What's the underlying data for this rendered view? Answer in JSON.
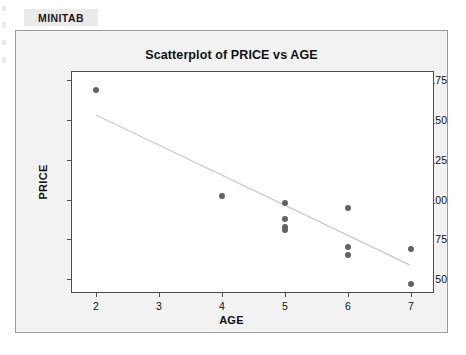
{
  "page": {
    "label": "MINITAB"
  },
  "chart_data": {
    "type": "scatter",
    "title": "Scatterplot of PRICE vs AGE",
    "xlabel": "AGE",
    "ylabel": "PRICE",
    "xlim": [
      1.62,
      7.35
    ],
    "ylim": [
      42,
      180
    ],
    "xticks": [
      2,
      3,
      4,
      5,
      6,
      7
    ],
    "yticks": [
      50,
      75,
      100,
      125,
      150,
      175
    ],
    "xtick_labels": [
      "2",
      "3",
      "4",
      "5",
      "6",
      "7"
    ],
    "ytick_labels": [
      "50",
      "75",
      "100",
      "125",
      "150",
      "175"
    ],
    "grid": false,
    "legend": false,
    "marker_color": "#636363",
    "fit_line_color": "#c9c9c9",
    "points": [
      {
        "x": 2,
        "y": 169
      },
      {
        "x": 4,
        "y": 102
      },
      {
        "x": 5,
        "y": 98
      },
      {
        "x": 5,
        "y": 88
      },
      {
        "x": 5,
        "y": 83
      },
      {
        "x": 5,
        "y": 81
      },
      {
        "x": 6,
        "y": 95
      },
      {
        "x": 6,
        "y": 70
      },
      {
        "x": 6,
        "y": 65
      },
      {
        "x": 7,
        "y": 69
      },
      {
        "x": 7,
        "y": 47
      }
    ],
    "fit_line": {
      "x_start": 2.0,
      "y_start": 153,
      "x_end": 6.98,
      "y_end": 59
    }
  }
}
